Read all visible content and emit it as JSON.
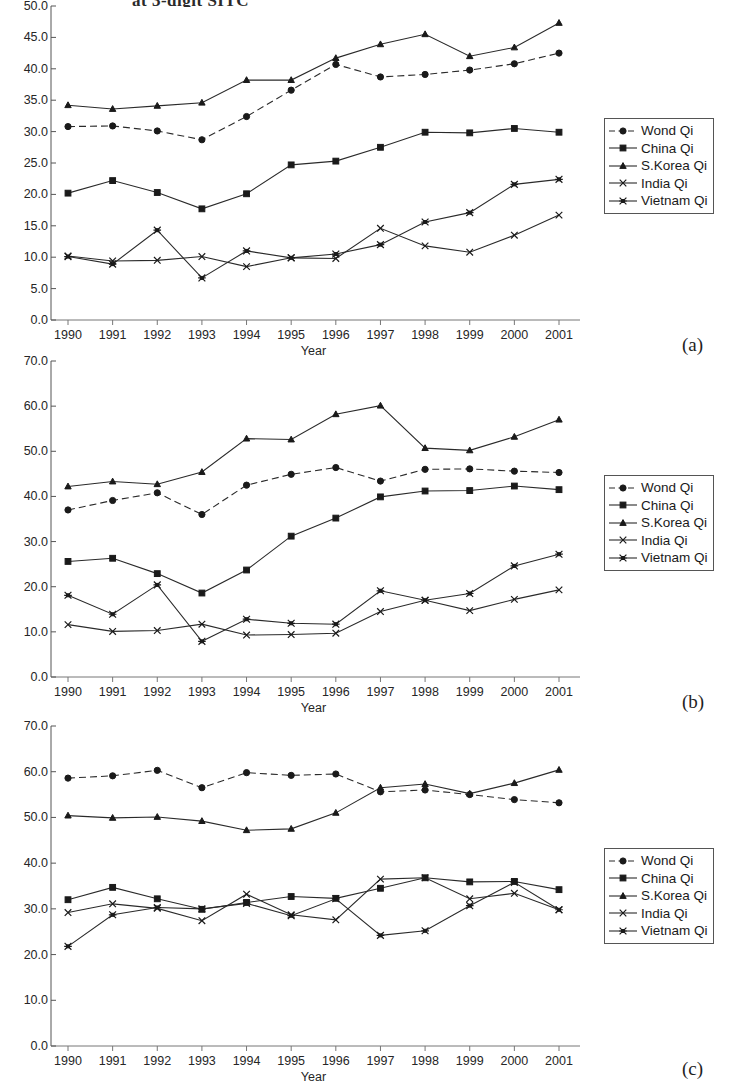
{
  "page": {
    "cut_off_title": "at 3-digit SITC",
    "axis_x_title": "Year",
    "panel_tags": [
      "(a)",
      "(b)",
      "(c)"
    ]
  },
  "legend": {
    "position": "right",
    "entries": [
      {
        "label": "Wond Qi",
        "marker": "circle",
        "line": "dashed"
      },
      {
        "label": "China Qi",
        "marker": "square",
        "line": "solid"
      },
      {
        "label": "S.Korea Qi",
        "marker": "triangle",
        "line": "solid"
      },
      {
        "label": "India Qi",
        "marker": "x",
        "line": "solid"
      },
      {
        "label": "Vietnam Qi",
        "marker": "asterisk",
        "line": "solid"
      }
    ]
  },
  "chart_data": [
    {
      "type": "line",
      "panel": "(a)",
      "title": "",
      "xlabel": "Year",
      "ylabel": "",
      "grid": false,
      "legend_position": "right",
      "categories": [
        "1990",
        "1991",
        "1992",
        "1993",
        "1994",
        "1995",
        "1996",
        "1997",
        "1998",
        "1999",
        "2000",
        "2001"
      ],
      "x": [
        1990,
        1991,
        1992,
        1993,
        1994,
        1995,
        1996,
        1997,
        1998,
        1999,
        2000,
        2001
      ],
      "ylim": [
        0.0,
        50.0
      ],
      "yticks": [
        "0.0",
        "5.0",
        "10.0",
        "15.0",
        "20.0",
        "25.0",
        "30.0",
        "35.0",
        "40.0",
        "45.0",
        "50.0"
      ],
      "series": [
        {
          "name": "Wond Qi",
          "marker": "circle",
          "line": "dashed",
          "values": [
            30.8,
            30.9,
            30.1,
            28.7,
            32.4,
            36.6,
            40.7,
            38.7,
            39.1,
            39.8,
            40.8,
            42.5
          ]
        },
        {
          "name": "China Qi",
          "marker": "square",
          "line": "solid",
          "values": [
            20.2,
            22.2,
            20.3,
            17.7,
            20.1,
            24.7,
            25.3,
            27.5,
            29.9,
            29.8,
            30.5,
            29.9
          ]
        },
        {
          "name": "S.Korea Qi",
          "marker": "triangle",
          "line": "solid",
          "values": [
            34.2,
            33.6,
            34.1,
            34.6,
            38.2,
            38.2,
            41.7,
            43.9,
            45.5,
            42.0,
            43.4,
            47.3
          ]
        },
        {
          "name": "India Qi",
          "marker": "x",
          "line": "solid",
          "values": [
            10.2,
            9.4,
            9.5,
            10.1,
            8.5,
            9.9,
            9.8,
            14.6,
            11.8,
            10.8,
            13.5,
            16.7
          ]
        },
        {
          "name": "Vietnam Qi",
          "marker": "asterisk",
          "line": "solid",
          "values": [
            10.1,
            8.9,
            14.3,
            6.7,
            11.0,
            9.9,
            10.5,
            12.0,
            15.6,
            17.1,
            21.6,
            22.4
          ]
        }
      ]
    },
    {
      "type": "line",
      "panel": "(b)",
      "title": "",
      "xlabel": "Year",
      "ylabel": "",
      "grid": false,
      "legend_position": "right",
      "categories": [
        "1990",
        "1991",
        "1992",
        "1993",
        "1994",
        "1995",
        "1996",
        "1997",
        "1998",
        "1999",
        "2000",
        "2001"
      ],
      "x": [
        1990,
        1991,
        1992,
        1993,
        1994,
        1995,
        1996,
        1997,
        1998,
        1999,
        2000,
        2001
      ],
      "ylim": [
        0.0,
        70.0
      ],
      "yticks": [
        "0.0",
        "10.0",
        "20.0",
        "30.0",
        "40.0",
        "50.0",
        "60.0",
        "70.0"
      ],
      "series": [
        {
          "name": "Wond Qi",
          "marker": "circle",
          "line": "dashed",
          "values": [
            37.0,
            39.1,
            40.8,
            36.0,
            42.5,
            44.9,
            46.4,
            43.4,
            46.0,
            46.1,
            45.6,
            45.3
          ]
        },
        {
          "name": "China Qi",
          "marker": "square",
          "line": "solid",
          "values": [
            25.6,
            26.3,
            22.9,
            18.6,
            23.7,
            31.2,
            35.2,
            39.9,
            41.2,
            41.3,
            42.3,
            41.5
          ]
        },
        {
          "name": "S.Korea Qi",
          "marker": "triangle",
          "line": "solid",
          "values": [
            42.2,
            43.3,
            42.7,
            45.4,
            52.8,
            52.6,
            58.2,
            60.1,
            50.7,
            50.2,
            53.2,
            57.0
          ]
        },
        {
          "name": "India Qi",
          "marker": "x",
          "line": "solid",
          "values": [
            11.6,
            10.1,
            10.3,
            11.7,
            9.3,
            9.4,
            9.7,
            14.5,
            17.0,
            14.7,
            17.2,
            19.3
          ]
        },
        {
          "name": "Vietnam Qi",
          "marker": "asterisk",
          "line": "solid",
          "values": [
            18.1,
            13.9,
            20.4,
            7.9,
            12.8,
            11.9,
            11.7,
            19.1,
            17.0,
            18.5,
            24.6,
            27.2
          ]
        }
      ]
    },
    {
      "type": "line",
      "panel": "(c)",
      "title": "",
      "xlabel": "Year",
      "ylabel": "",
      "grid": false,
      "legend_position": "right",
      "categories": [
        "1990",
        "1991",
        "1992",
        "1993",
        "1994",
        "1995",
        "1996",
        "1997",
        "1998",
        "1999",
        "2000",
        "2001"
      ],
      "x": [
        1990,
        1991,
        1992,
        1993,
        1994,
        1995,
        1996,
        1997,
        1998,
        1999,
        2000,
        2001
      ],
      "ylim": [
        0.0,
        70.0
      ],
      "yticks": [
        "0.0",
        "10.0",
        "20.0",
        "30.0",
        "40.0",
        "50.0",
        "60.0",
        "70.0"
      ],
      "series": [
        {
          "name": "Wond Qi",
          "marker": "circle",
          "line": "dashed",
          "values": [
            58.6,
            59.1,
            60.3,
            56.5,
            59.8,
            59.2,
            59.5,
            55.6,
            56.0,
            55.0,
            53.9,
            53.2
          ]
        },
        {
          "name": "China Qi",
          "marker": "square",
          "line": "solid",
          "values": [
            32.0,
            34.7,
            32.2,
            29.9,
            31.4,
            32.7,
            32.3,
            34.5,
            36.8,
            35.9,
            36.0,
            34.2
          ]
        },
        {
          "name": "S.Korea Qi",
          "marker": "triangle",
          "line": "solid",
          "values": [
            50.4,
            49.9,
            50.1,
            49.2,
            47.2,
            47.5,
            51.0,
            56.5,
            57.3,
            55.2,
            57.5,
            60.4
          ]
        },
        {
          "name": "India Qi",
          "marker": "x",
          "line": "solid",
          "values": [
            29.2,
            31.1,
            30.1,
            27.4,
            33.2,
            28.7,
            27.6,
            36.5,
            36.8,
            32.2,
            33.4,
            29.8
          ]
        },
        {
          "name": "Vietnam Qi",
          "marker": "asterisk",
          "line": "solid",
          "values": [
            21.8,
            28.7,
            30.3,
            30.0,
            31.2,
            28.5,
            32.2,
            24.2,
            25.2,
            30.7,
            35.8,
            29.8
          ]
        }
      ]
    }
  ]
}
